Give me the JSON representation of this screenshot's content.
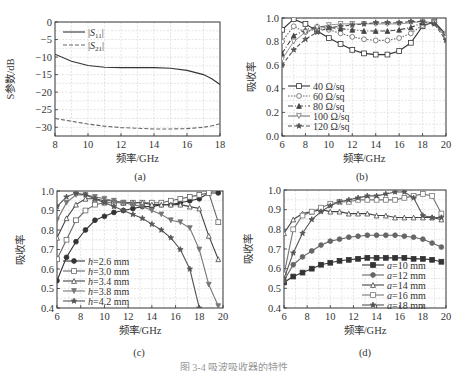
{
  "caption": "图 3-4  吸波吸收器的特性",
  "chart_data": [
    {
      "id": "a",
      "type": "line",
      "sublabel": "(a)",
      "title": "",
      "xlabel": "频率/GHz",
      "ylabel": "S参数/dB",
      "xlim": [
        8,
        18
      ],
      "ylim": [
        -32.5,
        0
      ],
      "xticks": [
        8,
        10,
        12,
        14,
        16,
        18
      ],
      "yticks": [
        0,
        -5,
        -10,
        -15,
        -20,
        -25,
        -30
      ],
      "grid": true,
      "legend_position": "upper left",
      "x": [
        8,
        9,
        10,
        11,
        12,
        13,
        14,
        15,
        16,
        17,
        17.5,
        18
      ],
      "series": [
        {
          "name": "|S11|",
          "style": "solid",
          "values": [
            -9.2,
            -11.2,
            -12.4,
            -12.9,
            -13.0,
            -13.0,
            -13.0,
            -13.2,
            -13.8,
            -15.0,
            -16.2,
            -17.8
          ]
        },
        {
          "name": "|S21|",
          "style": "dashed",
          "values": [
            -27.5,
            -28.3,
            -29.1,
            -29.7,
            -30.1,
            -30.3,
            -30.5,
            -30.5,
            -30.4,
            -30.0,
            -29.6,
            -29.0
          ]
        }
      ]
    },
    {
      "id": "b",
      "type": "line",
      "sublabel": "(b)",
      "title": "",
      "xlabel": "频率/GHz",
      "ylabel": "吸收率",
      "xlim": [
        6,
        20
      ],
      "ylim": [
        0.0,
        1.0
      ],
      "xticks": [
        6,
        8,
        10,
        12,
        14,
        16,
        18,
        20
      ],
      "yticks": [
        0.0,
        0.2,
        0.4,
        0.6,
        0.8,
        1.0
      ],
      "grid": true,
      "legend_position": "lower left",
      "x": [
        6,
        7,
        8,
        9,
        10,
        11,
        12,
        13,
        14,
        15,
        16,
        17,
        18,
        19,
        20
      ],
      "series": [
        {
          "name": "40 Ω/sq",
          "style": "solid",
          "marker": "open-square",
          "values": [
            0.9,
            0.99,
            0.95,
            0.89,
            0.83,
            0.78,
            0.73,
            0.7,
            0.69,
            0.69,
            0.72,
            0.79,
            0.93,
            0.97,
            0.86
          ]
        },
        {
          "name": "60 Ω/sq",
          "style": "dotted",
          "marker": "open-circle",
          "values": [
            0.8,
            0.93,
            0.88,
            0.91,
            0.9,
            0.87,
            0.84,
            0.82,
            0.81,
            0.81,
            0.83,
            0.87,
            0.94,
            0.96,
            0.85
          ]
        },
        {
          "name": "80 Ω/sq",
          "style": "dash-dot",
          "marker": "filled-triangle",
          "values": [
            0.7,
            0.85,
            0.9,
            0.93,
            0.92,
            0.91,
            0.9,
            0.89,
            0.89,
            0.89,
            0.9,
            0.92,
            0.96,
            0.96,
            0.84
          ]
        },
        {
          "name": "100 Ω/sq",
          "style": "solid-thin",
          "marker": "open-triangle-down",
          "values": [
            0.65,
            0.8,
            0.88,
            0.92,
            0.94,
            0.95,
            0.95,
            0.95,
            0.95,
            0.95,
            0.95,
            0.96,
            0.97,
            0.96,
            0.83
          ]
        },
        {
          "name": "120 Ω/sq",
          "style": "dashed",
          "marker": "filled-star",
          "values": [
            0.6,
            0.73,
            0.82,
            0.88,
            0.92,
            0.93,
            0.94,
            0.95,
            0.96,
            0.96,
            0.96,
            0.97,
            0.97,
            0.95,
            0.81
          ]
        }
      ]
    },
    {
      "id": "c",
      "type": "line",
      "sublabel": "(c)",
      "title": "",
      "xlabel": "频率/GHz",
      "ylabel": "吸收率",
      "xlim": [
        6,
        20
      ],
      "ylim": [
        0.4,
        1.0
      ],
      "xticks": [
        6,
        8,
        10,
        12,
        14,
        16,
        18,
        20
      ],
      "yticks": [
        0.4,
        0.5,
        0.6,
        0.7,
        0.8,
        0.9,
        1.0
      ],
      "grid": true,
      "legend_position": "lower left",
      "x": [
        6,
        6.8,
        7.6,
        8.4,
        9.2,
        10,
        10.8,
        11.6,
        12.4,
        13.2,
        14,
        14.8,
        15.6,
        16.4,
        17.2,
        18,
        18.8,
        19.6
      ],
      "series": [
        {
          "name": "h=2.6 mm",
          "marker": "filled-circle",
          "values": [
            0.54,
            0.66,
            0.74,
            0.8,
            0.85,
            0.87,
            0.89,
            0.9,
            0.91,
            0.92,
            0.92,
            0.93,
            0.93,
            0.94,
            0.95,
            0.96,
            0.99,
            0.99
          ]
        },
        {
          "name": "h=3.0 mm",
          "marker": "open-square",
          "values": [
            0.65,
            0.75,
            0.85,
            0.9,
            0.93,
            0.94,
            0.94,
            0.94,
            0.94,
            0.94,
            0.94,
            0.94,
            0.95,
            0.96,
            0.97,
            0.98,
            0.99,
            0.84
          ]
        },
        {
          "name": "h=3.4 mm",
          "marker": "open-triangle",
          "values": [
            0.76,
            0.86,
            0.93,
            0.96,
            0.96,
            0.95,
            0.95,
            0.94,
            0.94,
            0.94,
            0.93,
            0.93,
            0.93,
            0.93,
            0.92,
            0.91,
            0.77,
            0.65
          ]
        },
        {
          "name": "h=3.8 mm",
          "marker": "filled-triangle-down",
          "values": [
            0.85,
            0.94,
            0.98,
            0.98,
            0.97,
            0.96,
            0.95,
            0.94,
            0.93,
            0.92,
            0.9,
            0.88,
            0.85,
            0.84,
            0.81,
            0.7,
            0.52,
            0.41
          ]
        },
        {
          "name": "h=4.2 mm",
          "marker": "filled-star",
          "values": [
            0.92,
            0.97,
            0.99,
            0.98,
            0.96,
            0.94,
            0.92,
            0.9,
            0.88,
            0.86,
            0.83,
            0.8,
            0.76,
            0.7,
            0.6,
            0.4,
            null,
            null
          ]
        }
      ]
    },
    {
      "id": "d",
      "type": "line",
      "sublabel": "(d)",
      "title": "",
      "xlabel": "频率/GHz",
      "ylabel": "吸收率",
      "xlim": [
        6,
        20
      ],
      "ylim": [
        0.4,
        1.0
      ],
      "xticks": [
        6,
        8,
        10,
        12,
        14,
        16,
        18,
        20
      ],
      "yticks": [
        0.4,
        0.5,
        0.6,
        0.7,
        0.8,
        0.9,
        1.0
      ],
      "grid": true,
      "legend_position": "lower right",
      "x": [
        6,
        6.8,
        7.6,
        8.4,
        9.2,
        10,
        10.8,
        11.6,
        12.4,
        13.2,
        14,
        14.8,
        15.6,
        16.4,
        17.2,
        18,
        18.8,
        19.6
      ],
      "series": [
        {
          "name": "a=10 mm",
          "marker": "filled-square",
          "values": [
            0.53,
            0.56,
            0.58,
            0.6,
            0.62,
            0.63,
            0.64,
            0.645,
            0.65,
            0.655,
            0.655,
            0.655,
            0.655,
            0.655,
            0.65,
            0.65,
            0.645,
            0.635
          ]
        },
        {
          "name": "a=12 mm",
          "marker": "filled-circle",
          "values": [
            0.54,
            0.62,
            0.66,
            0.69,
            0.72,
            0.74,
            0.75,
            0.76,
            0.765,
            0.77,
            0.77,
            0.77,
            0.77,
            0.765,
            0.76,
            0.75,
            0.73,
            0.71
          ]
        },
        {
          "name": "a=14 mm",
          "marker": "open-triangle",
          "values": [
            0.78,
            0.85,
            0.88,
            0.89,
            0.9,
            0.89,
            0.89,
            0.88,
            0.88,
            0.88,
            0.87,
            0.87,
            0.86,
            0.86,
            0.86,
            0.86,
            0.86,
            0.85
          ]
        },
        {
          "name": "a=16 mm",
          "marker": "open-square",
          "values": [
            0.57,
            0.8,
            0.87,
            0.89,
            0.91,
            0.93,
            0.94,
            0.94,
            0.95,
            0.95,
            0.95,
            0.95,
            0.95,
            0.96,
            0.97,
            0.98,
            0.97,
            0.88
          ]
        },
        {
          "name": "a=18 mm",
          "marker": "filled-star",
          "values": [
            0.55,
            0.68,
            0.78,
            0.85,
            0.89,
            0.92,
            0.94,
            0.95,
            0.96,
            0.97,
            0.97,
            0.98,
            0.99,
            0.99,
            0.96,
            0.87,
            0.86,
            0.86
          ]
        }
      ]
    }
  ]
}
